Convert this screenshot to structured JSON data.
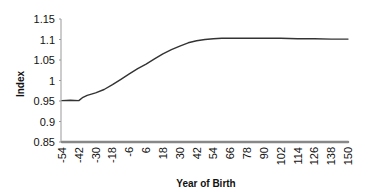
{
  "chart_data": {
    "type": "line",
    "title": "",
    "xlabel": "Year of Birth",
    "ylabel": "Index",
    "x_tick_labels": [
      "-54",
      "-42",
      "-30",
      "-18",
      "-6",
      "6",
      "18",
      "30",
      "42",
      "54",
      "66",
      "78",
      "90",
      "102",
      "114",
      "126",
      "138",
      "150"
    ],
    "y_tick_labels": [
      "0.85",
      "0.9",
      "0.95",
      "1",
      "1.05",
      "1.1",
      "1.15"
    ],
    "ylim": [
      0.85,
      1.15
    ],
    "xlim": [
      -54,
      150
    ],
    "grid": false,
    "legend": null,
    "series": [
      {
        "name": "Index",
        "color": "#333333",
        "x": [
          -54,
          -48,
          -42,
          -39,
          -36,
          -30,
          -24,
          -18,
          -12,
          -6,
          0,
          6,
          12,
          18,
          24,
          30,
          36,
          42,
          48,
          54,
          60,
          66,
          78,
          90,
          102,
          114,
          126,
          138,
          150
        ],
        "values": [
          0.951,
          0.952,
          0.951,
          0.959,
          0.964,
          0.97,
          0.978,
          0.99,
          1.003,
          1.016,
          1.029,
          1.04,
          1.053,
          1.065,
          1.075,
          1.084,
          1.092,
          1.097,
          1.1,
          1.102,
          1.103,
          1.103,
          1.103,
          1.103,
          1.103,
          1.102,
          1.102,
          1.101,
          1.101
        ]
      },
      {
        "name": "Baseline",
        "color": "#888888",
        "x": [
          -54,
          150
        ],
        "values": [
          0.85,
          0.85
        ]
      }
    ]
  }
}
